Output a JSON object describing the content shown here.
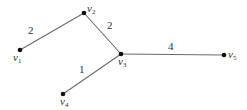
{
  "diagram": {
    "type": "weighted-graph",
    "colors": {
      "edge": "#6b6b6b",
      "node": "#111111",
      "text": "#333333"
    },
    "nodes": [
      {
        "id": "v1",
        "name": "v",
        "sub": "1",
        "x": 20,
        "y": 50,
        "label_x": 13,
        "label_y": 52
      },
      {
        "id": "v2",
        "name": "v",
        "sub": "2",
        "x": 84,
        "y": 13,
        "label_x": 87,
        "label_y": 3
      },
      {
        "id": "v3",
        "name": "v",
        "sub": "3",
        "x": 121,
        "y": 54,
        "label_x": 118,
        "label_y": 56
      },
      {
        "id": "v4",
        "name": "v",
        "sub": "4",
        "x": 63,
        "y": 94,
        "label_x": 60,
        "label_y": 96
      },
      {
        "id": "v5",
        "name": "v",
        "sub": "5",
        "x": 224,
        "y": 55,
        "label_x": 228,
        "label_y": 49
      }
    ],
    "edges": [
      {
        "from": "v1",
        "to": "v2",
        "weight": "2",
        "label_x": 28,
        "label_y": 25
      },
      {
        "from": "v2",
        "to": "v3",
        "weight": "2",
        "label_x": 107,
        "label_y": 20
      },
      {
        "from": "v3",
        "to": "v4",
        "weight": "1",
        "label_x": 79,
        "label_y": 64
      },
      {
        "from": "v3",
        "to": "v5",
        "weight": "4",
        "label_x": 168,
        "label_y": 41
      }
    ]
  }
}
